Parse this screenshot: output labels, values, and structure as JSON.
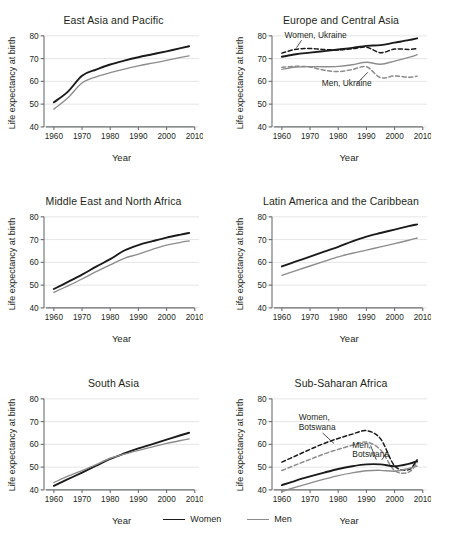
{
  "figure": {
    "width": 455,
    "height": 544,
    "background": "#ffffff"
  },
  "legend": {
    "items": [
      {
        "label": "Women",
        "color": "#1a1a1a",
        "width": 1.9,
        "dash": "none"
      },
      {
        "label": "Men",
        "color": "#8c8c8c",
        "width": 1.4,
        "dash": "none"
      }
    ]
  },
  "axes_common": {
    "xlabel": "Year",
    "ylabel": "Life expectancy at birth",
    "xticks": [
      1960,
      1970,
      1980,
      1990,
      2000,
      2010
    ],
    "yticks": [
      40,
      50,
      60,
      70,
      80
    ],
    "xlim": [
      1956.5,
      2011.5
    ],
    "ylim": [
      36,
      83
    ],
    "grid": "horizontal",
    "grid_color": "#e2e2e2",
    "axis_color": "#6d6e71"
  },
  "colors": {
    "women": "#1a1a1a",
    "men": "#8c8c8c",
    "women_dashed": "#1a1a1a",
    "men_dashed": "#8c8c8c",
    "grid": "#e2e2e2",
    "axis": "#6d6e71",
    "text": "#231f20"
  },
  "chart_data": [
    {
      "type": "line",
      "title": "East Asia and Pacific",
      "xlabel": "Year",
      "ylabel": "Life expectancy at birth",
      "xlim": [
        1956.5,
        2011.5
      ],
      "ylim": [
        36,
        83
      ],
      "xticks": [
        1960,
        1970,
        1980,
        1990,
        2000,
        2010
      ],
      "yticks": [
        40,
        50,
        60,
        70,
        80
      ],
      "grid": "horizontal",
      "legend": "bottom (shared)",
      "x": [
        1960,
        1965,
        1970,
        1975,
        1980,
        1985,
        1990,
        1995,
        2000,
        2005,
        2008
      ],
      "series": [
        {
          "name": "Women",
          "style": "solid",
          "color": "#1a1a1a",
          "values": [
            50.8,
            55.5,
            62.5,
            65.2,
            67.4,
            69.1,
            70.6,
            71.9,
            73.2,
            74.6,
            75.4
          ]
        },
        {
          "name": "Men",
          "style": "solid",
          "color": "#8c8c8c",
          "values": [
            47.8,
            52.8,
            59.3,
            62.0,
            63.8,
            65.4,
            66.8,
            68.0,
            69.2,
            70.5,
            71.2
          ]
        }
      ],
      "annotations": []
    },
    {
      "type": "line",
      "title": "Europe and Central Asia",
      "xlabel": "Year",
      "ylabel": "Life expectancy at birth",
      "xlim": [
        1956.5,
        2011.5
      ],
      "ylim": [
        36,
        83
      ],
      "xticks": [
        1960,
        1970,
        1980,
        1990,
        2000,
        2010
      ],
      "yticks": [
        40,
        50,
        60,
        70,
        80
      ],
      "grid": "horizontal",
      "legend": "bottom (shared)",
      "x": [
        1960,
        1965,
        1970,
        1975,
        1980,
        1985,
        1990,
        1995,
        2000,
        2005,
        2008
      ],
      "series": [
        {
          "name": "Women",
          "style": "solid",
          "color": "#1a1a1a",
          "values": [
            70.8,
            71.9,
            72.6,
            73.3,
            74.0,
            74.7,
            75.6,
            75.9,
            77.0,
            78.1,
            78.9
          ]
        },
        {
          "name": "Men",
          "style": "solid",
          "color": "#8c8c8c",
          "values": [
            65.3,
            66.3,
            66.5,
            66.4,
            66.6,
            67.3,
            68.4,
            67.5,
            68.9,
            70.5,
            71.7
          ]
        },
        {
          "name": "Women, Ukraine",
          "style": "dashed",
          "color": "#1a1a1a",
          "values": [
            72.4,
            74.1,
            74.4,
            74.0,
            73.8,
            74.3,
            75.0,
            72.6,
            74.2,
            74.0,
            74.4
          ]
        },
        {
          "name": "Men, Ukraine",
          "style": "dashed",
          "color": "#8c8c8c",
          "values": [
            66.2,
            66.6,
            66.3,
            64.9,
            64.3,
            65.2,
            66.4,
            61.6,
            62.4,
            61.8,
            62.3
          ]
        }
      ],
      "annotations": [
        {
          "text": "Women, Ukraine",
          "x": 1972,
          "y": 79.2
        },
        {
          "text": "Men, Ukraine",
          "x": 1983,
          "y": 57.8
        }
      ]
    },
    {
      "type": "line",
      "title": "Middle East and North Africa",
      "xlabel": "Year",
      "ylabel": "Life expectancy at birth",
      "xlim": [
        1956.5,
        2011.5
      ],
      "ylim": [
        36,
        83
      ],
      "xticks": [
        1960,
        1970,
        1980,
        1990,
        2000,
        2010
      ],
      "yticks": [
        40,
        50,
        60,
        70,
        80
      ],
      "grid": "horizontal",
      "legend": "bottom (shared)",
      "x": [
        1960,
        1965,
        1970,
        1975,
        1980,
        1985,
        1990,
        1995,
        2000,
        2005,
        2008
      ],
      "series": [
        {
          "name": "Women",
          "style": "solid",
          "color": "#1a1a1a",
          "values": [
            48.3,
            51.4,
            54.6,
            58.1,
            61.4,
            65.2,
            67.6,
            69.3,
            70.9,
            72.2,
            72.9
          ]
        },
        {
          "name": "Men",
          "style": "solid",
          "color": "#8c8c8c",
          "values": [
            46.8,
            49.7,
            52.7,
            55.9,
            58.9,
            61.8,
            63.6,
            65.7,
            67.6,
            68.8,
            69.4
          ]
        }
      ],
      "annotations": []
    },
    {
      "type": "line",
      "title": "Latin America and the Caribbean",
      "xlabel": "Year",
      "ylabel": "Life expectancy at birth",
      "xlim": [
        1956.5,
        2011.5
      ],
      "ylim": [
        36,
        83
      ],
      "xticks": [
        1960,
        1970,
        1980,
        1990,
        2000,
        2010
      ],
      "yticks": [
        40,
        50,
        60,
        70,
        80
      ],
      "grid": "horizontal",
      "legend": "bottom (shared)",
      "x": [
        1960,
        1965,
        1970,
        1975,
        1980,
        1985,
        1990,
        1995,
        2000,
        2005,
        2008
      ],
      "series": [
        {
          "name": "Women",
          "style": "solid",
          "color": "#1a1a1a",
          "values": [
            58.2,
            60.4,
            62.5,
            64.7,
            66.8,
            69.2,
            71.3,
            72.9,
            74.4,
            75.9,
            76.7
          ]
        },
        {
          "name": "Men",
          "style": "solid",
          "color": "#8c8c8c",
          "values": [
            54.3,
            56.4,
            58.4,
            60.4,
            62.4,
            64.0,
            65.4,
            66.8,
            68.2,
            69.7,
            70.7
          ]
        }
      ],
      "annotations": []
    },
    {
      "type": "line",
      "title": "South Asia",
      "xlabel": "Year",
      "ylabel": "Life expectancy at birth",
      "xlim": [
        1956.5,
        2011.5
      ],
      "ylim": [
        36,
        83
      ],
      "xticks": [
        1960,
        1970,
        1980,
        1990,
        2000,
        2010
      ],
      "yticks": [
        40,
        50,
        60,
        70,
        80
      ],
      "grid": "horizontal",
      "legend": "bottom (shared)",
      "x": [
        1960,
        1965,
        1970,
        1975,
        1980,
        1985,
        1990,
        1995,
        2000,
        2005,
        2008
      ],
      "series": [
        {
          "name": "Women",
          "style": "solid",
          "color": "#1a1a1a",
          "values": [
            41.8,
            44.7,
            47.6,
            50.6,
            53.6,
            56.0,
            58.2,
            60.1,
            62.1,
            64.0,
            65.1
          ]
        },
        {
          "name": "Men",
          "style": "solid",
          "color": "#8c8c8c",
          "values": [
            43.2,
            46.0,
            48.5,
            51.1,
            53.9,
            55.7,
            57.4,
            58.9,
            60.4,
            61.7,
            62.4
          ]
        }
      ],
      "annotations": []
    },
    {
      "type": "line",
      "title": "Sub-Saharan Africa",
      "xlabel": "Year",
      "ylabel": "Life expectancy at birth",
      "xlim": [
        1956.5,
        2011.5
      ],
      "ylim": [
        36,
        83
      ],
      "xticks": [
        1960,
        1970,
        1980,
        1990,
        2000,
        2010
      ],
      "yticks": [
        40,
        50,
        60,
        70,
        80
      ],
      "grid": "horizontal",
      "legend": "bottom (shared)",
      "x": [
        1960,
        1965,
        1970,
        1975,
        1980,
        1985,
        1990,
        1995,
        2000,
        2005,
        2008
      ],
      "series": [
        {
          "name": "Women",
          "style": "solid",
          "color": "#1a1a1a",
          "values": [
            42.1,
            44.1,
            45.9,
            47.6,
            49.2,
            50.4,
            51.2,
            51.2,
            50.4,
            51.4,
            52.6
          ]
        },
        {
          "name": "Men",
          "style": "solid",
          "color": "#8c8c8c",
          "values": [
            39.3,
            41.2,
            43.0,
            44.7,
            46.3,
            47.5,
            48.4,
            48.6,
            48.2,
            49.4,
            50.5
          ]
        },
        {
          "name": "Women, Botswana",
          "style": "dashed",
          "color": "#1a1a1a",
          "values": [
            52.2,
            55.0,
            57.8,
            60.4,
            62.6,
            64.5,
            66.0,
            62.5,
            50.6,
            48.9,
            53.2
          ]
        },
        {
          "name": "Men, Botswana",
          "style": "dashed",
          "color": "#8c8c8c",
          "values": [
            48.5,
            51.0,
            53.4,
            55.8,
            57.8,
            59.6,
            61.0,
            57.6,
            48.5,
            47.8,
            51.9
          ]
        }
      ],
      "annotations": [
        {
          "text": "Women,",
          "x": 1966,
          "y": 70.6
        },
        {
          "text": "Botswana",
          "x": 1966,
          "y": 66.4
        },
        {
          "text": "Men,",
          "x": 1985,
          "y": 58.6
        },
        {
          "text": "Botswana",
          "x": 1985,
          "y": 54.4
        }
      ]
    }
  ]
}
